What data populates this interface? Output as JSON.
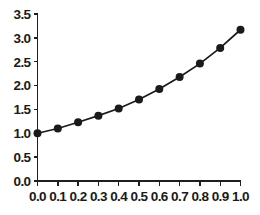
{
  "chart_data": {
    "type": "line",
    "title": "",
    "subtitle": "",
    "xlabel": "",
    "ylabel": "",
    "x": [
      0.0,
      0.1,
      0.2,
      0.3,
      0.4,
      0.5,
      0.6,
      0.7,
      0.8,
      0.9,
      1.0
    ],
    "values": [
      1.0,
      1.1,
      1.23,
      1.37,
      1.52,
      1.71,
      1.93,
      2.18,
      2.46,
      2.79,
      3.17
    ],
    "series": [
      {
        "name": "",
        "values": [
          1.0,
          1.1,
          1.23,
          1.37,
          1.52,
          1.71,
          1.93,
          2.18,
          2.46,
          2.79,
          3.17
        ]
      }
    ],
    "xlim": [
      0.0,
      1.0
    ],
    "ylim": [
      0.0,
      3.5
    ],
    "xticks": [
      0.0,
      0.1,
      0.2,
      0.3,
      0.4,
      0.5,
      0.6,
      0.7,
      0.8,
      0.9,
      1.0
    ],
    "yticks": [
      0.0,
      0.5,
      1.0,
      1.5,
      2.0,
      2.5,
      3.0,
      3.5
    ],
    "xtick_labels": [
      "0.0",
      "0.1",
      "0.2",
      "0.3",
      "0.4",
      "0.5",
      "0.6",
      "0.7",
      "0.8",
      "0.9",
      "1.0"
    ],
    "ytick_labels": [
      "0.0",
      "0.5",
      "1.0",
      "1.5",
      "2.0",
      "2.5",
      "3.0",
      "3.5"
    ],
    "grid": false,
    "legend": null,
    "legend_position": "none",
    "marker": "filled-circle",
    "line_color": "#1a1a1a",
    "marker_color": "#1a1a1a",
    "axis_color": "#1f1f1f",
    "background": "#ffffff",
    "annotations": []
  }
}
